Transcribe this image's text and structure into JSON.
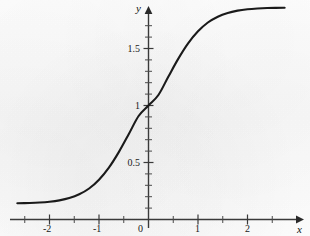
{
  "figure": {
    "title": "",
    "background_color": "#fdfdfd",
    "curve_color": "#1a1a1a",
    "axis_color": "#3a3a3a"
  },
  "axes": {
    "x_axis_name": "x",
    "y_axis_name": "y",
    "x_tick_labels": [
      "-2",
      "-1",
      "0",
      "1",
      "2"
    ],
    "y_tick_labels": [
      "0.5",
      "1",
      "1.5"
    ]
  },
  "chart_data": {
    "type": "line",
    "title": "",
    "xlabel": "x",
    "ylabel": "y",
    "xlim": [
      -2.65,
      2.75
    ],
    "ylim": [
      -0.12,
      2.0
    ],
    "grid": false,
    "legend": null,
    "x_ticks": [
      -2,
      -1,
      0,
      1,
      2
    ],
    "x_tick_labels": [
      "-2",
      "-1",
      "0",
      "1",
      "2"
    ],
    "x_minor_tick_step": 0.5,
    "y_ticks": [
      0.5,
      1,
      1.5
    ],
    "y_tick_labels": [
      "0.5",
      "1",
      "1.5"
    ],
    "y_minor_tick_step": 0.1,
    "lower_asymptote": 0.14,
    "upper_asymptote": 1.86,
    "inflection_point": [
      0,
      1
    ],
    "series": [
      {
        "name": "sigmoid",
        "x": [
          -2.65,
          -2.4,
          -2.2,
          -2.0,
          -1.8,
          -1.6,
          -1.4,
          -1.2,
          -1.0,
          -0.8,
          -0.6,
          -0.4,
          -0.2,
          0.0,
          0.2,
          0.4,
          0.6,
          0.8,
          1.0,
          1.2,
          1.4,
          1.6,
          1.8,
          2.0,
          2.2,
          2.4,
          2.75
        ],
        "y": [
          0.142,
          0.145,
          0.149,
          0.156,
          0.168,
          0.188,
          0.221,
          0.272,
          0.349,
          0.455,
          0.591,
          0.748,
          0.908,
          1.0,
          1.092,
          1.252,
          1.409,
          1.545,
          1.651,
          1.728,
          1.779,
          1.812,
          1.832,
          1.844,
          1.851,
          1.855,
          1.858
        ]
      }
    ]
  }
}
